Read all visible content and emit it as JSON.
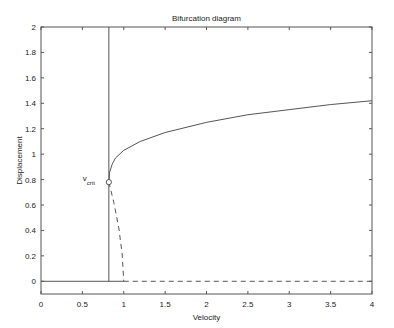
{
  "chart_data": {
    "type": "line",
    "title": "Bifurcation diagram",
    "xlabel": "Velocity",
    "ylabel": "Displacement",
    "xlim": [
      0,
      4
    ],
    "ylim": [
      -0.1,
      2
    ],
    "xticks": [
      "0",
      "0.5",
      "1",
      "1.5",
      "2",
      "2.5",
      "3",
      "3.5",
      "4"
    ],
    "yticks": [
      "0",
      "0.2",
      "0.4",
      "0.6",
      "0.8",
      "1",
      "1.2",
      "1.4",
      "1.6",
      "1.8",
      "2"
    ],
    "grid": false,
    "annotation": {
      "text": "v",
      "subscript": "crit",
      "x": 0.82,
      "y": 0.78
    },
    "series": [
      {
        "name": "stable upper branch",
        "style": "solid",
        "x": [
          0.82,
          0.83,
          0.86,
          0.9,
          1.0,
          1.2,
          1.5,
          2.0,
          2.5,
          3.0,
          3.5,
          4.0
        ],
        "y": [
          0.78,
          0.86,
          0.92,
          0.97,
          1.03,
          1.1,
          1.17,
          1.25,
          1.31,
          1.35,
          1.39,
          1.42
        ]
      },
      {
        "name": "unstable branch",
        "style": "dashed",
        "x": [
          0.82,
          0.88,
          0.94,
          0.98,
          1.0
        ],
        "y": [
          0.78,
          0.62,
          0.42,
          0.22,
          0.0
        ]
      },
      {
        "name": "stable zero branch",
        "style": "solid",
        "x": [
          0,
          1.0
        ],
        "y": [
          0,
          0
        ]
      },
      {
        "name": "unstable zero branch",
        "style": "dashed",
        "x": [
          1.0,
          4.0
        ],
        "y": [
          0,
          0
        ]
      },
      {
        "name": "vertical line v_crit",
        "style": "solid",
        "x": [
          0.82,
          0.82
        ],
        "y": [
          0,
          2
        ]
      }
    ]
  }
}
